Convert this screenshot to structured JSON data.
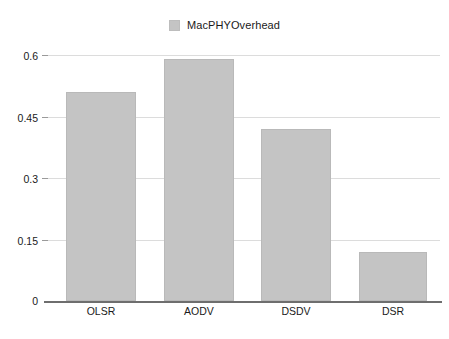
{
  "chart_data": {
    "type": "bar",
    "title": "",
    "subtitle": "",
    "xlabel": "",
    "ylabel": "",
    "categories": [
      "OLSR",
      "AODV",
      "DSDV",
      "DSR"
    ],
    "series": [
      {
        "name": "MacPHYOverhead",
        "color": "#c4c4c4",
        "values": [
          0.51,
          0.59,
          0.42,
          0.12
        ]
      }
    ],
    "ylim": [
      0,
      0.6
    ],
    "yticks": [
      0,
      0.15,
      0.3,
      0.45,
      0.6
    ],
    "ytick_labels": [
      "0",
      "0.15",
      "0.3",
      "0.45",
      "0.6"
    ],
    "grid": true,
    "grid_axis": "y",
    "legend": {
      "position": "top-center",
      "entries": [
        {
          "label": "MacPHYOverhead",
          "color": "#c4c4c4"
        }
      ]
    },
    "background_color": "#ffffff",
    "gridline_color": "#dcdcdc",
    "axis_color": "#6e6e6e",
    "text_color": "#1a1a1a"
  }
}
